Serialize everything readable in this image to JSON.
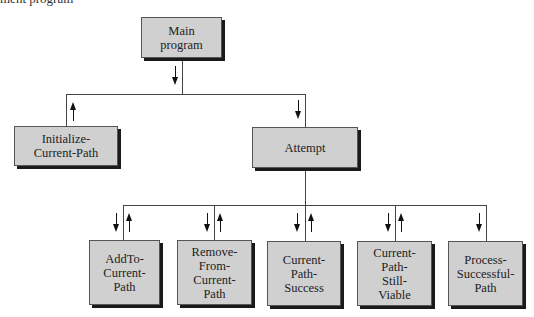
{
  "caption": "ment program",
  "colors": {
    "box_fill": "#d0d0d0",
    "box_border": "#555555",
    "shadow": "#1a1a1a",
    "line": "#444444"
  },
  "nodes": {
    "main": {
      "label": "Main\nprogram"
    },
    "initialize": {
      "label": "Initialize-\nCurrent-Path"
    },
    "attempt": {
      "label": "Attempt"
    },
    "add_to": {
      "label": "AddTo-\nCurrent-\nPath"
    },
    "remove_from": {
      "label": "Remove-\nFrom-\nCurrent-\nPath"
    },
    "success": {
      "label": "Current-\nPath-\nSuccess"
    },
    "still_viable": {
      "label": "Current-\nPath-\nStill-\nViable"
    },
    "process": {
      "label": "Process-\nSuccessful-\nPath"
    }
  },
  "edges": [
    {
      "from": "main",
      "to": "initialize",
      "arrows": [
        "up"
      ]
    },
    {
      "from": "main",
      "to": "attempt",
      "arrows": [
        "down"
      ]
    },
    {
      "from": "attempt",
      "to": "add_to",
      "arrows": [
        "down",
        "up"
      ]
    },
    {
      "from": "attempt",
      "to": "remove_from",
      "arrows": [
        "down",
        "up"
      ]
    },
    {
      "from": "attempt",
      "to": "success",
      "arrows": [
        "down",
        "up"
      ]
    },
    {
      "from": "attempt",
      "to": "still_viable",
      "arrows": [
        "down",
        "up"
      ]
    },
    {
      "from": "attempt",
      "to": "process",
      "arrows": [
        "down"
      ]
    }
  ]
}
